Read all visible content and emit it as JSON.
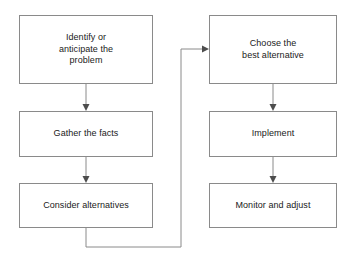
{
  "diagram": {
    "background_color": "#ffffff",
    "line_color": "#8a8a8a",
    "text_color": "#1a1a1a",
    "nodes": [
      {
        "id": "identify",
        "label": "Identify or\nanticipate the\nproblem",
        "x": 19,
        "y": 15,
        "width": 134,
        "height": 69,
        "column": "left"
      },
      {
        "id": "gather",
        "label": "Gather the facts",
        "x": 19,
        "y": 111,
        "width": 134,
        "height": 46,
        "column": "left"
      },
      {
        "id": "consider",
        "label": "Consider alternatives",
        "x": 19,
        "y": 183,
        "width": 134,
        "height": 45,
        "column": "left"
      },
      {
        "id": "choose",
        "label": "Choose the\nbest alternative",
        "x": 209,
        "y": 15,
        "width": 128,
        "height": 69,
        "column": "right"
      },
      {
        "id": "implement",
        "label": "Implement",
        "x": 209,
        "y": 111,
        "width": 128,
        "height": 46,
        "column": "right"
      },
      {
        "id": "monitor",
        "label": "Monitor and adjust",
        "x": 209,
        "y": 183,
        "width": 128,
        "height": 45,
        "column": "right"
      }
    ],
    "connectors": [
      {
        "id": "identify-to-gather",
        "from": "identify",
        "to": "gather",
        "type": "straight-down",
        "arrowhead": true
      },
      {
        "id": "gather-to-consider",
        "from": "gather",
        "to": "consider",
        "type": "straight-down",
        "arrowhead": true
      },
      {
        "id": "consider-to-choose",
        "from": "consider",
        "to": "choose",
        "type": "elbow-loop",
        "arrowhead": true
      },
      {
        "id": "choose-to-implement",
        "from": "choose",
        "to": "implement",
        "type": "straight-down",
        "arrowhead": true
      },
      {
        "id": "implement-to-monitor",
        "from": "implement",
        "to": "monitor",
        "type": "straight-down",
        "arrowhead": true
      }
    ]
  }
}
